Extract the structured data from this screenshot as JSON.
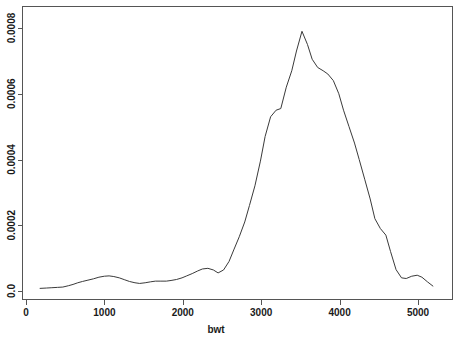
{
  "chart_data": {
    "type": "line",
    "title": "",
    "subtitle": "",
    "xlabel": "bwt",
    "ylabel": "",
    "xlim": [
      0,
      5400
    ],
    "ylim": [
      0,
      0.00085
    ],
    "grid": false,
    "legend": null,
    "xticks": [
      0,
      1000,
      2000,
      3000,
      4000,
      5000
    ],
    "xtick_labels": [
      "0",
      "1000",
      "2000",
      "3000",
      "4000",
      "5000"
    ],
    "yticks": [
      0.0,
      0.0002,
      0.0004,
      0.0006,
      0.0008
    ],
    "ytick_labels": [
      "0.0",
      "0.0002",
      "0.0004",
      "0.0006",
      "0.0008"
    ],
    "series": [
      {
        "name": "density",
        "x": [
          180,
          260,
          330,
          400,
          470,
          540,
          600,
          660,
          720,
          790,
          860,
          930,
          1000,
          1060,
          1120,
          1190,
          1260,
          1320,
          1390,
          1450,
          1520,
          1590,
          1650,
          1720,
          1790,
          1850,
          1920,
          1990,
          2050,
          2120,
          2190,
          2250,
          2320,
          2390,
          2450,
          2520,
          2590,
          2650,
          2720,
          2790,
          2850,
          2920,
          2990,
          3050,
          3120,
          3190,
          3250,
          3320,
          3390,
          3450,
          3520,
          3590,
          3650,
          3720,
          3790,
          3850,
          3920,
          3990,
          4050,
          4120,
          4190,
          4250,
          4320,
          4390,
          4450,
          4520,
          4590,
          4650,
          4720,
          4790,
          4850,
          4920,
          4990,
          5050,
          5120,
          5190
        ],
        "y": [
          8e-06,
          9e-06,
          1e-05,
          1.1e-05,
          1.2e-05,
          1.6e-05,
          2e-05,
          2.5e-05,
          2.9e-05,
          3.3e-05,
          3.7e-05,
          4.2e-05,
          4.5e-05,
          4.6e-05,
          4.4e-05,
          4e-05,
          3.4e-05,
          2.9e-05,
          2.5e-05,
          2.3e-05,
          2.5e-05,
          2.8e-05,
          3e-05,
          3e-05,
          3e-05,
          3.2e-05,
          3.5e-05,
          4e-05,
          4.6e-05,
          5.3e-05,
          6.1e-05,
          6.7e-05,
          6.9e-05,
          6.4e-05,
          5.5e-05,
          6.4e-05,
          9e-05,
          0.000125,
          0.000165,
          0.00021,
          0.00026,
          0.00032,
          0.000395,
          0.00047,
          0.00053,
          0.00055,
          0.000555,
          0.00062,
          0.00067,
          0.00073,
          0.00079,
          0.00075,
          0.000705,
          0.00068,
          0.00067,
          0.00066,
          0.00064,
          0.0006,
          0.00055,
          0.0005,
          0.00045,
          0.0004,
          0.00034,
          0.00028,
          0.00022,
          0.00019,
          0.00017,
          0.00012,
          6.5e-05,
          4e-05,
          3.8e-05,
          4.5e-05,
          4.8e-05,
          4.2e-05,
          2.8e-05,
          1.5e-05
        ]
      }
    ]
  }
}
